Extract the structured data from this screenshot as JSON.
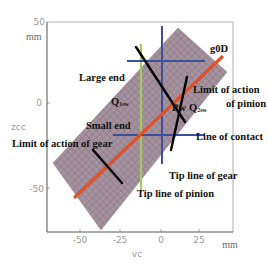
{
  "figure": {
    "type": "gear contact diagram",
    "x_axis": {
      "name": "vc",
      "unit": "mm",
      "ticks": [
        "-50",
        "-25",
        "0",
        "25"
      ]
    },
    "y_axis": {
      "name": "zcc",
      "unit": "mm",
      "ticks": [
        "50",
        "0",
        "-50"
      ]
    },
    "labels": {
      "g0d": "g0D",
      "large_end": "Large end",
      "q1sw": "Q",
      "q1sw_sub": "1sw",
      "pw": "Pw",
      "q2sw": "Q",
      "q2sw_sub": "2sw",
      "limit_pinion_1": "Limit of action",
      "limit_pinion_2": "of pinion",
      "small_end": "Small end",
      "line_of_contact": "Line of contact",
      "limit_gear": "Limit of action of gear",
      "tip_line_gear": "Tip line of gear",
      "tip_line_pinion": "Tip line of pinion"
    },
    "colors": {
      "surface_fill": "#a08c9c",
      "surface_grid": "#6f6470",
      "path_of_contact": "#e0522a",
      "tip_lines_blue": "#3b4f9a",
      "tip_line_green": "#a8c860",
      "contact_lines": "#000000",
      "frame": "#777777"
    }
  }
}
